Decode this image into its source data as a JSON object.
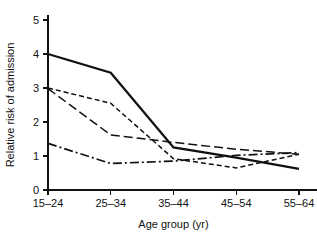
{
  "chart_data": {
    "type": "line",
    "title": "",
    "xlabel": "Age group (yr)",
    "ylabel": "Relative risk of admission",
    "categories": [
      "15–24",
      "25–34",
      "35–44",
      "45–54",
      "55–64"
    ],
    "ylim": [
      0,
      5
    ],
    "yticks": [
      0,
      1,
      2,
      3,
      4,
      5
    ],
    "ytick_labels": [
      "0",
      "1",
      "2",
      "3",
      "4",
      "5"
    ],
    "grid": false,
    "legend": "none",
    "series": [
      {
        "name": "series-1",
        "style": "solid",
        "color": "#111111",
        "values": [
          4.0,
          3.45,
          1.25,
          0.95,
          0.62
        ]
      },
      {
        "name": "series-2",
        "style": "short-dash",
        "color": "#111111",
        "values": [
          3.0,
          2.55,
          0.92,
          0.65,
          1.05
        ]
      },
      {
        "name": "series-3",
        "style": "long-dash",
        "color": "#111111",
        "values": [
          2.98,
          1.62,
          1.4,
          1.2,
          1.05
        ]
      },
      {
        "name": "series-4",
        "style": "dash-dot",
        "color": "#111111",
        "values": [
          1.37,
          0.78,
          0.85,
          1.02,
          1.1
        ]
      }
    ]
  },
  "axis": {
    "x_title": "Age group (yr)",
    "y_title": "Relative risk of admission",
    "x_tick_labels": [
      "15–24",
      "25–34",
      "35–44",
      "45–54",
      "55–64"
    ],
    "y_tick_labels": [
      "0",
      "1",
      "2",
      "3",
      "4",
      "5"
    ]
  }
}
